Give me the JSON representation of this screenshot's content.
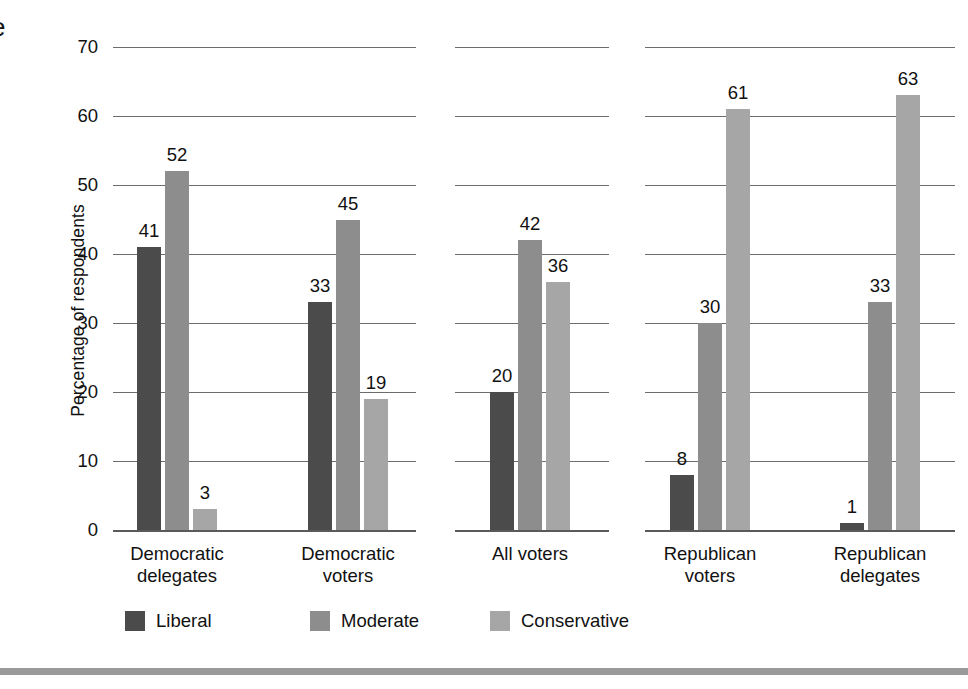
{
  "edge_glyph": "e",
  "chart_data": {
    "type": "bar",
    "title": "",
    "xlabel": "",
    "ylabel": "Percentage of respondents",
    "ylim": [
      0,
      70
    ],
    "ytick_step": 10,
    "ytick_labels": [
      "0",
      "10",
      "20",
      "30",
      "40",
      "50",
      "60",
      "70"
    ],
    "grid": true,
    "grid_panels": 3,
    "legend_position": "bottom-left",
    "categories": [
      "Democratic delegates",
      "Democratic voters",
      "All voters",
      "Republican voters",
      "Republican delegates"
    ],
    "category_lines": [
      [
        "Democratic",
        "delegates"
      ],
      [
        "Democratic",
        "voters"
      ],
      [
        "All voters"
      ],
      [
        "Republican",
        "voters"
      ],
      [
        "Republican",
        "delegates"
      ]
    ],
    "series": [
      {
        "name": "Liberal",
        "color": "#4b4b4b",
        "values": [
          41,
          33,
          20,
          8,
          1
        ]
      },
      {
        "name": "Moderate",
        "color": "#8d8d8d",
        "values": [
          52,
          45,
          42,
          30,
          33
        ]
      },
      {
        "name": "Conservative",
        "color": "#a6a6a6",
        "values": [
          3,
          19,
          36,
          61,
          63
        ]
      }
    ],
    "panels": [
      {
        "name": "democratic",
        "categories": [
          "Democratic delegates",
          "Democratic voters"
        ]
      },
      {
        "name": "all-voters",
        "categories": [
          "All voters"
        ]
      },
      {
        "name": "republican",
        "categories": [
          "Republican voters",
          "Republican delegates"
        ]
      }
    ]
  },
  "legend": {
    "items": [
      {
        "label": "Liberal",
        "color": "#4b4b4b"
      },
      {
        "label": "Moderate",
        "color": "#8d8d8d"
      },
      {
        "label": "Conservative",
        "color": "#a6a6a6"
      }
    ]
  }
}
